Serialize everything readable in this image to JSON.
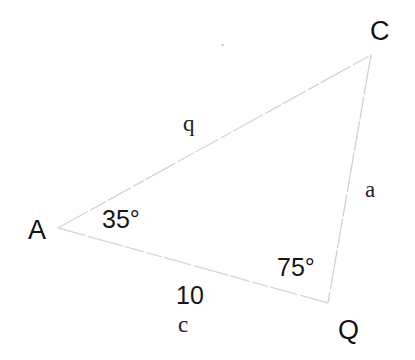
{
  "diagram": {
    "type": "triangle",
    "background_color": "#ffffff",
    "line_color": "#d2d2d2",
    "text_color": "#1f1f1f",
    "vertices": [
      {
        "name": "A",
        "label": "A",
        "x": 58,
        "y": 228
      },
      {
        "name": "C",
        "label": "C",
        "x": 371,
        "y": 55
      },
      {
        "name": "Q",
        "label": "Q",
        "x": 328,
        "y": 303
      }
    ],
    "vertex_labels": {
      "A": "A",
      "C": "C",
      "Q": "Q"
    },
    "angles": {
      "at_A": "35°",
      "at_Q": "75°"
    },
    "sides": {
      "AC_name": "q",
      "CQ_name": "a",
      "AQ_name": "c",
      "AQ_length": "10"
    },
    "artifacts": {
      "speck": "scan-speck"
    }
  }
}
